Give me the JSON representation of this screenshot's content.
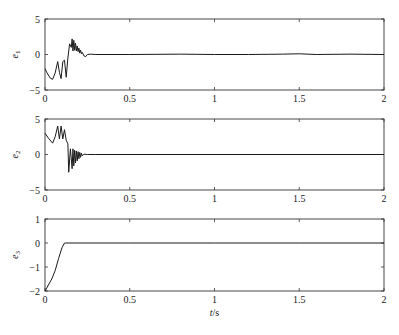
{
  "chart_data": [
    {
      "type": "line",
      "title": "",
      "xlabel": "",
      "ylabel": "e1",
      "ylabel_main": "e",
      "ylabel_sub": "1",
      "xlim": [
        0,
        2
      ],
      "ylim": [
        -5,
        5
      ],
      "xticks": [
        0,
        0.5,
        1,
        1.5,
        2
      ],
      "xtick_labels": [
        "0",
        "0.5",
        "1",
        "1.5",
        "2"
      ],
      "yticks": [
        -5,
        0,
        5
      ],
      "ytick_labels": [
        "-5",
        "0",
        "5"
      ],
      "grid": false,
      "series": [
        {
          "name": "e1",
          "x": [
            0,
            0.01,
            0.03,
            0.045,
            0.06,
            0.075,
            0.085,
            0.095,
            0.105,
            0.115,
            0.125,
            0.135,
            0.145,
            0.155,
            0.16,
            0.165,
            0.17,
            0.175,
            0.18,
            0.185,
            0.19,
            0.195,
            0.2,
            0.205,
            0.21,
            0.215,
            0.22,
            0.23,
            0.24,
            0.25,
            0.27,
            0.3,
            0.5,
            0.8,
            1.0,
            1.2,
            1.4,
            1.5,
            1.6,
            1.8,
            2.0
          ],
          "y": [
            -2.0,
            -2.5,
            -3.3,
            -3.5,
            -2.6,
            -1.0,
            -2.5,
            -3.4,
            -1.0,
            -0.8,
            -3.2,
            -0.5,
            1.5,
            1.0,
            2.2,
            0.5,
            2.0,
            0.6,
            1.6,
            0.5,
            1.2,
            0.4,
            0.9,
            0.2,
            0.6,
            0.1,
            0.3,
            -0.2,
            -0.3,
            0.0,
            0.05,
            0.0,
            0.0,
            0.05,
            0.0,
            0.0,
            0.05,
            0.1,
            0.0,
            0.05,
            0.0
          ]
        }
      ]
    },
    {
      "type": "line",
      "title": "",
      "xlabel": "",
      "ylabel": "e2",
      "ylabel_main": "e",
      "ylabel_sub": "2",
      "xlim": [
        0,
        2
      ],
      "ylim": [
        -5,
        5
      ],
      "xticks": [
        0,
        0.5,
        1,
        1.5,
        2
      ],
      "xtick_labels": [
        "0",
        "0.5",
        "1",
        "1.5",
        "2"
      ],
      "yticks": [
        -5,
        0,
        5
      ],
      "ytick_labels": [
        "-5",
        "0",
        "5"
      ],
      "grid": false,
      "series": [
        {
          "name": "e2",
          "x": [
            0,
            0.02,
            0.045,
            0.06,
            0.075,
            0.085,
            0.095,
            0.105,
            0.115,
            0.125,
            0.135,
            0.14,
            0.15,
            0.16,
            0.165,
            0.17,
            0.175,
            0.18,
            0.185,
            0.19,
            0.195,
            0.2,
            0.205,
            0.21,
            0.215,
            0.22,
            0.23,
            0.25,
            0.3,
            2.0
          ],
          "y": [
            3.0,
            2.3,
            1.6,
            2.5,
            4.0,
            2.2,
            4.0,
            2.2,
            3.5,
            2.0,
            1.5,
            -2.5,
            0.8,
            -2.0,
            0.8,
            -1.6,
            0.6,
            -1.2,
            0.5,
            -0.9,
            0.4,
            -0.6,
            0.3,
            -0.4,
            0.2,
            -0.2,
            0.05,
            0.0,
            0.0,
            0.0
          ]
        }
      ]
    },
    {
      "type": "line",
      "title": "",
      "xlabel": "t/s",
      "xlabel_italic": "t",
      "xlabel_unit": "/s",
      "ylabel": "e3",
      "ylabel_main": "e",
      "ylabel_sub": "3",
      "xlim": [
        0,
        2
      ],
      "ylim": [
        -2,
        1
      ],
      "xticks": [
        0,
        0.5,
        1,
        1.5,
        2
      ],
      "xtick_labels": [
        "0",
        "0.5",
        "1",
        "1.5",
        "2"
      ],
      "yticks": [
        -2,
        -1,
        0,
        1
      ],
      "ytick_labels": [
        "-2",
        "-1",
        "0",
        "1"
      ],
      "grid": false,
      "series": [
        {
          "name": "e3",
          "x": [
            0,
            0.02,
            0.04,
            0.06,
            0.08,
            0.1,
            0.115,
            0.12,
            0.5,
            1.0,
            1.5,
            2.0
          ],
          "y": [
            -2.0,
            -1.75,
            -1.5,
            -1.15,
            -0.65,
            -0.2,
            0.0,
            0.0,
            0.0,
            0.0,
            0.0,
            0.0
          ]
        }
      ]
    }
  ],
  "layout": {
    "plot_left": 45,
    "plot_right": 384,
    "panels": [
      {
        "top": 19,
        "bottom": 90
      },
      {
        "top": 119,
        "bottom": 190
      },
      {
        "top": 219,
        "bottom": 291
      }
    ],
    "xlabel_y": 316,
    "line_color": "#1a1a1a",
    "frame_color": "#333333"
  }
}
